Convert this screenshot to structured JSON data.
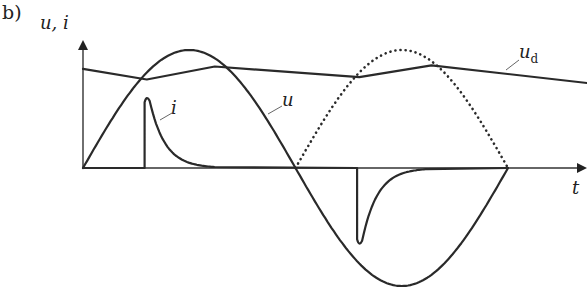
{
  "figure": {
    "panel_label": "b)",
    "y_axis_label": "u, i",
    "x_axis_label": "t",
    "curve_labels": {
      "u": "u",
      "i": "i",
      "ud_main": "u",
      "ud_sub": "d"
    }
  },
  "chart_data": {
    "type": "line",
    "title": "",
    "xlabel": "t",
    "ylabel": "u, i",
    "x_range_periods": [
      0,
      1.0
    ],
    "series": [
      {
        "name": "u",
        "style": "solid",
        "shape": "sine",
        "amplitude": 1.0,
        "periods": 1
      },
      {
        "name": "|u| (rectified, 2nd half)",
        "style": "dotted",
        "shape": "rectified-sine",
        "from_phase": 0.5,
        "to_phase": 1.0
      },
      {
        "name": "u_d",
        "style": "solid",
        "shape": "sawtooth",
        "points": [
          [
            0,
            0.84
          ],
          [
            0.15,
            0.75
          ],
          [
            0.31,
            0.86
          ],
          [
            0.65,
            0.77
          ],
          [
            0.82,
            0.87
          ],
          [
            1.2,
            0.72
          ]
        ]
      },
      {
        "name": "i",
        "style": "solid",
        "shape": "pulse",
        "pulses": [
          {
            "start_phase": 0.145,
            "peak": 0.62,
            "sign": 1
          },
          {
            "start_phase": 0.645,
            "peak": -0.67,
            "sign": -1
          }
        ]
      }
    ]
  }
}
